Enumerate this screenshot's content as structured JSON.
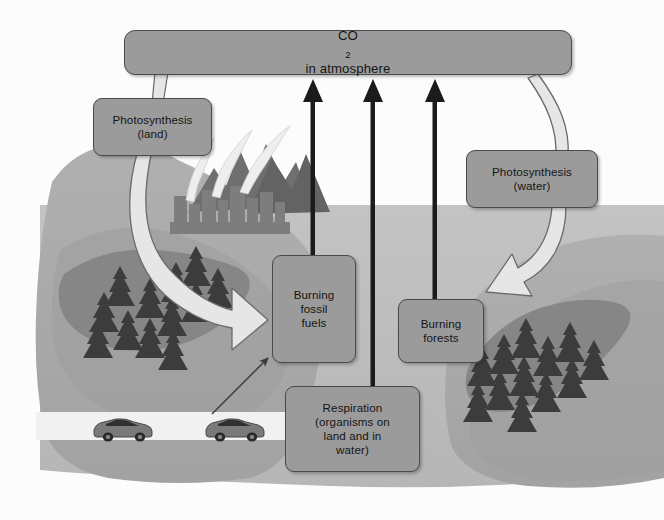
{
  "diagram": {
    "canvas": {
      "width": 664,
      "height": 520
    },
    "palette": {
      "background": "#ffffff",
      "sky": "#fbfbfb",
      "land": "#a9a9a9",
      "land_dark": "#8f8f8f",
      "forest_patch": "#8a8a8a",
      "water": "#bcbcbc",
      "mountain": "#6e6e6e",
      "city": "#7c7c7c",
      "tree": "#3f3f3f",
      "road": "#f0f0f0",
      "box_fill": "#9b9b9b",
      "box_stroke": "#4a4a4a",
      "arrow_black": "#1b1b1b",
      "arrow_white_fill": "#e4e4e4",
      "arrow_white_stroke": "#5d5d5d",
      "text": "#151515"
    }
  },
  "boxes": {
    "co2": {
      "label": "CO",
      "subscript": "2",
      "label_tail": " in atmosphere"
    },
    "photosynthesis_land": {
      "line1": "Photosynthesis",
      "line2": "(land)"
    },
    "photosynthesis_water": {
      "line1": "Photosynthesis",
      "line2": "(water)"
    },
    "burning_fossil_fuels": {
      "line1": "Burning",
      "line2": "fossil",
      "line3": "fuels"
    },
    "burning_forests": {
      "line1": "Burning",
      "line2": "forests"
    },
    "respiration": {
      "line1": "Respiration",
      "line2": "(organisms on",
      "line3": "land and in",
      "line4": "water)"
    }
  },
  "connectors": [
    {
      "name": "co2-to-photosynthesis-land",
      "kind": "pipe",
      "from": "co2",
      "to": "photosynthesis_land"
    },
    {
      "name": "photosynthesis-land-to-forest",
      "kind": "white-curved-arrow",
      "from": "photosynthesis_land",
      "to": "land-forest"
    },
    {
      "name": "co2-to-photosynthesis-water",
      "kind": "pipe",
      "from": "co2",
      "to": "photosynthesis_water"
    },
    {
      "name": "photosynthesis-water-to-ocean",
      "kind": "white-curved-arrow",
      "from": "photosynthesis_water",
      "to": "water"
    },
    {
      "name": "burning-fossil-fuels-to-co2",
      "kind": "black-arrow-up",
      "from": "burning_fossil_fuels",
      "to": "co2"
    },
    {
      "name": "respiration-to-co2",
      "kind": "black-arrow-up",
      "from": "respiration",
      "to": "co2"
    },
    {
      "name": "burning-forests-to-co2",
      "kind": "black-arrow-up",
      "from": "burning_forests",
      "to": "co2"
    },
    {
      "name": "cars-to-burning-fossil-fuels",
      "kind": "thin-arrow",
      "from": "cars",
      "to": "burning_fossil_fuels"
    }
  ],
  "scenery": {
    "left_landmass": "land",
    "right_landmass": "land",
    "ocean": "water between landmasses",
    "mountains": "mountain range behind city",
    "city": "industrial city skyline with smoke plumes",
    "forests": [
      {
        "name": "left-forest",
        "tree_count": 14
      },
      {
        "name": "right-forest",
        "tree_count": 14
      }
    ],
    "road": {
      "name": "highway",
      "vehicles": 2
    }
  }
}
